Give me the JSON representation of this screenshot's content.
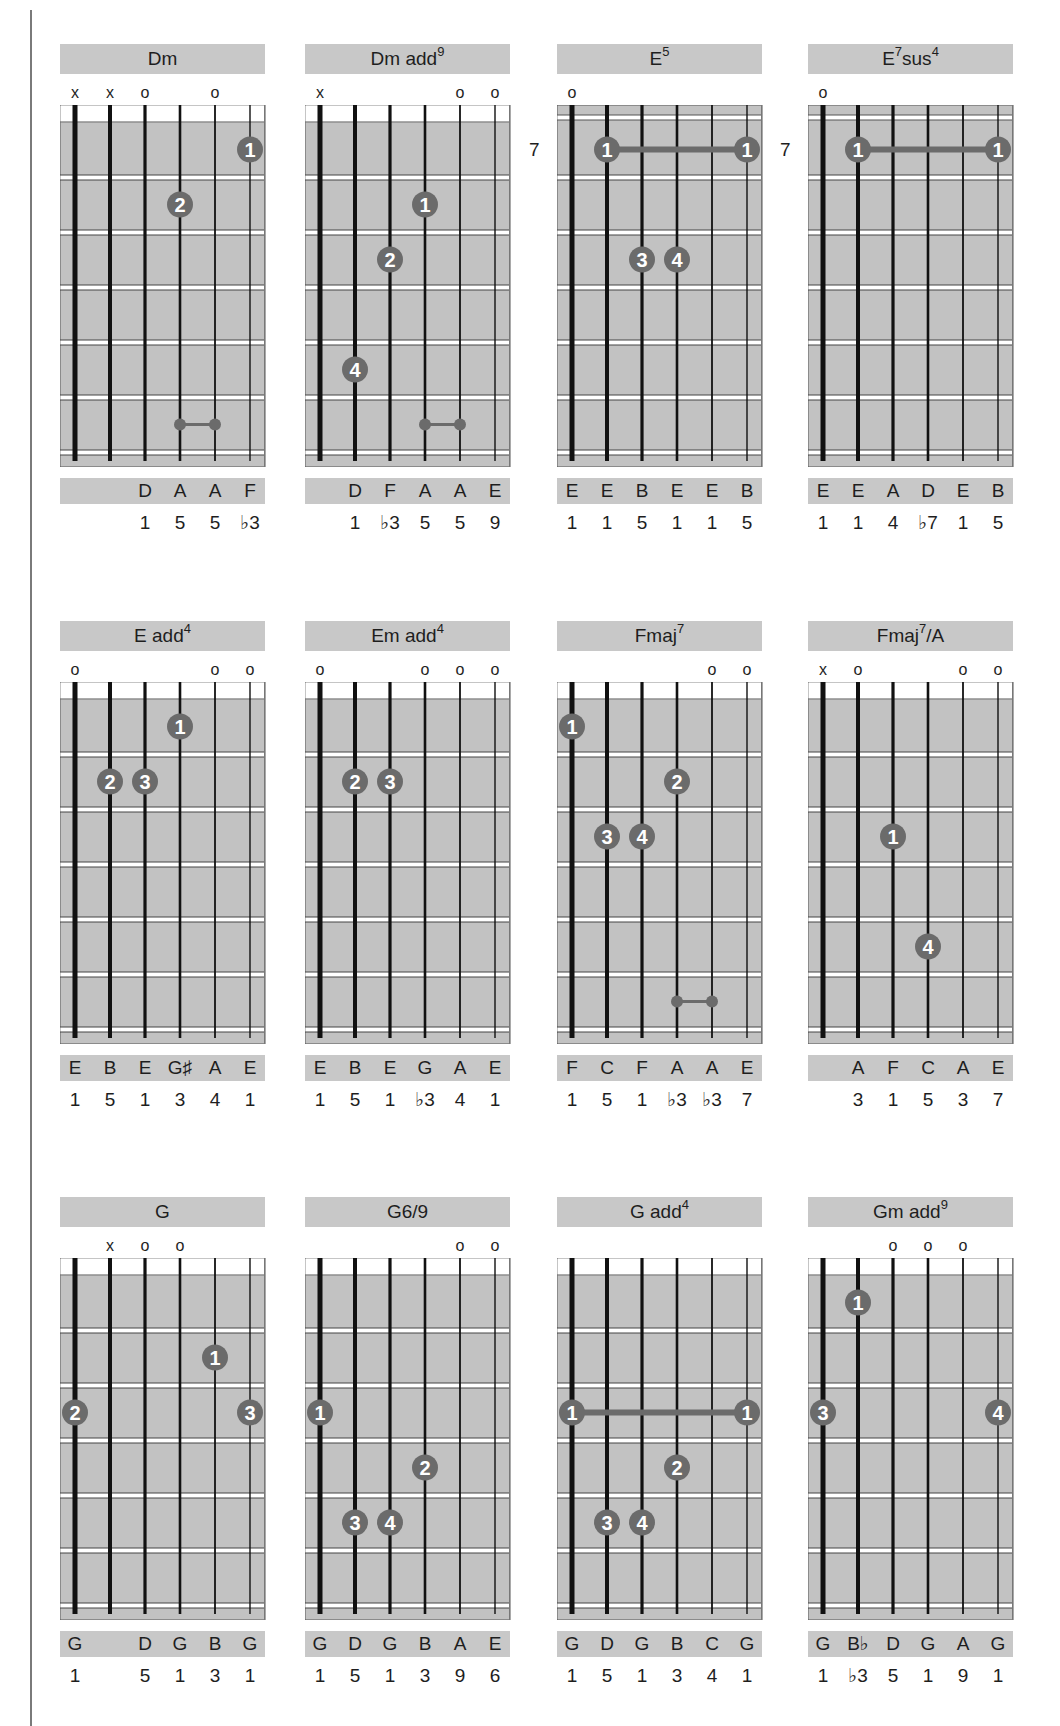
{
  "page": {
    "colors": {
      "panel_gray": "#c8c8c8",
      "fretboard_gray": "#c2c2c2",
      "dot_fill": "#6b6b6b",
      "dot_text": "#ffffff",
      "string": "#111111",
      "fret_line": "#444444"
    }
  },
  "chords": [
    {
      "name": "Dm",
      "sup": "",
      "suffix": "",
      "row": 0,
      "col": 0,
      "markers": [
        "x",
        "x",
        "o",
        "",
        "o",
        ""
      ],
      "fret_number": "",
      "dots": [
        {
          "string": 6,
          "fret": 1,
          "label": "1"
        },
        {
          "string": 4,
          "fret": 2,
          "label": "2"
        }
      ],
      "barres": [],
      "small_links": [
        {
          "from": 4,
          "to": 5,
          "fret": 6
        }
      ],
      "notes": [
        "",
        "",
        "D",
        "A",
        "A",
        "F"
      ],
      "degrees": [
        "",
        "",
        "1",
        "5",
        "5",
        "♭3"
      ]
    },
    {
      "name": "Dm add",
      "sup": "9",
      "suffix": "",
      "row": 0,
      "col": 1,
      "markers": [
        "x",
        "",
        "",
        "",
        "o",
        "o"
      ],
      "fret_number": "",
      "dots": [
        {
          "string": 4,
          "fret": 2,
          "label": "1"
        },
        {
          "string": 3,
          "fret": 3,
          "label": "2"
        },
        {
          "string": 2,
          "fret": 5,
          "label": "4"
        }
      ],
      "barres": [],
      "small_links": [
        {
          "from": 4,
          "to": 5,
          "fret": 6
        }
      ],
      "notes": [
        "",
        "D",
        "F",
        "A",
        "A",
        "E"
      ],
      "degrees": [
        "",
        "1",
        "♭3",
        "5",
        "5",
        "9"
      ]
    },
    {
      "name": "E",
      "sup": "5",
      "suffix": "",
      "row": 0,
      "col": 2,
      "markers": [
        "o",
        "",
        "",
        "",
        "",
        ""
      ],
      "fret_number": "7",
      "dots": [
        {
          "string": 3,
          "fret": 3,
          "label": "3"
        },
        {
          "string": 4,
          "fret": 3,
          "label": "4"
        }
      ],
      "barres": [
        {
          "from": 2,
          "to": 6,
          "fret": 1,
          "label": "1"
        }
      ],
      "small_links": [],
      "notes": [
        "E",
        "E",
        "B",
        "E",
        "E",
        "B"
      ],
      "degrees": [
        "1",
        "1",
        "5",
        "1",
        "1",
        "5"
      ]
    },
    {
      "name": "E",
      "sup": "7",
      "suffix": "sus",
      "sup2": "4",
      "row": 0,
      "col": 3,
      "markers": [
        "o",
        "",
        "",
        "",
        "",
        ""
      ],
      "fret_number": "7",
      "dots": [],
      "barres": [
        {
          "from": 2,
          "to": 6,
          "fret": 1,
          "label": "1"
        }
      ],
      "small_links": [],
      "notes": [
        "E",
        "E",
        "A",
        "D",
        "E",
        "B"
      ],
      "degrees": [
        "1",
        "1",
        "4",
        "♭7",
        "1",
        "5"
      ]
    },
    {
      "name": "E add",
      "sup": "4",
      "suffix": "",
      "row": 1,
      "col": 0,
      "markers": [
        "o",
        "",
        "",
        "",
        "o",
        "o"
      ],
      "fret_number": "",
      "dots": [
        {
          "string": 4,
          "fret": 1,
          "label": "1"
        },
        {
          "string": 2,
          "fret": 2,
          "label": "2"
        },
        {
          "string": 3,
          "fret": 2,
          "label": "3"
        }
      ],
      "barres": [],
      "small_links": [],
      "notes": [
        "E",
        "B",
        "E",
        "G♯",
        "A",
        "E"
      ],
      "degrees": [
        "1",
        "5",
        "1",
        "3",
        "4",
        "1"
      ]
    },
    {
      "name": "Em add",
      "sup": "4",
      "suffix": "",
      "row": 1,
      "col": 1,
      "markers": [
        "o",
        "",
        "",
        "o",
        "o",
        "o"
      ],
      "fret_number": "",
      "dots": [
        {
          "string": 2,
          "fret": 2,
          "label": "2"
        },
        {
          "string": 3,
          "fret": 2,
          "label": "3"
        }
      ],
      "barres": [],
      "small_links": [],
      "notes": [
        "E",
        "B",
        "E",
        "G",
        "A",
        "E"
      ],
      "degrees": [
        "1",
        "5",
        "1",
        "♭3",
        "4",
        "1"
      ]
    },
    {
      "name": "Fmaj",
      "sup": "7",
      "suffix": "",
      "row": 1,
      "col": 2,
      "markers": [
        "",
        "",
        "",
        "",
        "o",
        "o"
      ],
      "fret_number": "",
      "dots": [
        {
          "string": 1,
          "fret": 1,
          "label": "1"
        },
        {
          "string": 4,
          "fret": 2,
          "label": "2"
        },
        {
          "string": 2,
          "fret": 3,
          "label": "3"
        },
        {
          "string": 3,
          "fret": 3,
          "label": "4"
        }
      ],
      "barres": [],
      "small_links": [
        {
          "from": 4,
          "to": 5,
          "fret": 6
        }
      ],
      "notes": [
        "F",
        "C",
        "F",
        "A",
        "A",
        "E"
      ],
      "degrees": [
        "1",
        "5",
        "1",
        "♭3",
        "♭3",
        "7"
      ]
    },
    {
      "name": "Fmaj",
      "sup": "7",
      "suffix": "/A",
      "row": 1,
      "col": 3,
      "markers": [
        "x",
        "o",
        "",
        "",
        "o",
        "o"
      ],
      "fret_number": "",
      "dots": [
        {
          "string": 3,
          "fret": 3,
          "label": "1"
        },
        {
          "string": 4,
          "fret": 5,
          "label": "4"
        }
      ],
      "barres": [],
      "small_links": [],
      "notes": [
        "",
        "A",
        "F",
        "C",
        "A",
        "E"
      ],
      "degrees": [
        "",
        "3",
        "1",
        "5",
        "3",
        "7"
      ]
    },
    {
      "name": "G",
      "sup": "",
      "suffix": "",
      "row": 2,
      "col": 0,
      "markers": [
        "",
        "x",
        "o",
        "o",
        "",
        ""
      ],
      "fret_number": "",
      "dots": [
        {
          "string": 5,
          "fret": 2,
          "label": "1"
        },
        {
          "string": 1,
          "fret": 3,
          "label": "2"
        },
        {
          "string": 6,
          "fret": 3,
          "label": "3"
        }
      ],
      "barres": [],
      "small_links": [],
      "notes": [
        "G",
        "",
        "D",
        "G",
        "B",
        "G"
      ],
      "degrees": [
        "1",
        "",
        "5",
        "1",
        "3",
        "1"
      ]
    },
    {
      "name": "G6/9",
      "sup": "",
      "suffix": "",
      "row": 2,
      "col": 1,
      "markers": [
        "",
        "",
        "",
        "",
        "o",
        "o"
      ],
      "fret_number": "",
      "dots": [
        {
          "string": 1,
          "fret": 3,
          "label": "1"
        },
        {
          "string": 4,
          "fret": 4,
          "label": "2"
        },
        {
          "string": 2,
          "fret": 5,
          "label": "3"
        },
        {
          "string": 3,
          "fret": 5,
          "label": "4"
        }
      ],
      "barres": [],
      "small_links": [],
      "notes": [
        "G",
        "D",
        "G",
        "B",
        "A",
        "E"
      ],
      "degrees": [
        "1",
        "5",
        "1",
        "3",
        "9",
        "6"
      ]
    },
    {
      "name": "G add",
      "sup": "4",
      "suffix": "",
      "row": 2,
      "col": 2,
      "markers": [
        "",
        "",
        "",
        "",
        "",
        ""
      ],
      "fret_number": "",
      "dots": [
        {
          "string": 4,
          "fret": 4,
          "label": "2"
        },
        {
          "string": 2,
          "fret": 5,
          "label": "3"
        },
        {
          "string": 3,
          "fret": 5,
          "label": "4"
        }
      ],
      "barres": [
        {
          "from": 1,
          "to": 6,
          "fret": 3,
          "label": "1"
        }
      ],
      "small_links": [],
      "notes": [
        "G",
        "D",
        "G",
        "B",
        "C",
        "G"
      ],
      "degrees": [
        "1",
        "5",
        "1",
        "3",
        "4",
        "1"
      ]
    },
    {
      "name": "Gm add",
      "sup": "9",
      "suffix": "",
      "row": 2,
      "col": 3,
      "markers": [
        "",
        "",
        "o",
        "o",
        "o",
        ""
      ],
      "fret_number": "",
      "dots": [
        {
          "string": 2,
          "fret": 1,
          "label": "1"
        },
        {
          "string": 1,
          "fret": 3,
          "label": "3"
        },
        {
          "string": 6,
          "fret": 3,
          "label": "4"
        }
      ],
      "barres": [],
      "small_links": [],
      "notes": [
        "G",
        "B♭",
        "D",
        "G",
        "A",
        "G"
      ],
      "degrees": [
        "1",
        "♭3",
        "5",
        "1",
        "9",
        "1"
      ]
    }
  ]
}
